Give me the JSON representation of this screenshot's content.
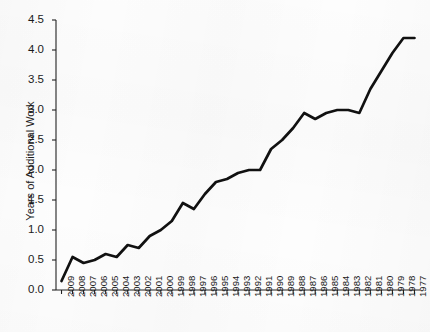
{
  "chart_data": {
    "type": "line",
    "title": "",
    "xlabel": "",
    "ylabel": "Years of Additional Work",
    "ylim": [
      0.0,
      4.5
    ],
    "ytick_labels": [
      "0.0",
      "0.5",
      "1.0",
      "1.5",
      "2.0",
      "2.5",
      "3.0",
      "3.5",
      "4.0",
      "4.5"
    ],
    "ytick_values": [
      0.0,
      0.5,
      1.0,
      1.5,
      2.0,
      2.5,
      3.0,
      3.5,
      4.0,
      4.5
    ],
    "grid": false,
    "legend": false,
    "legend_position": "none",
    "line_color": "#111111",
    "categories": [
      "2009",
      "2008",
      "2007",
      "2006",
      "2005",
      "2004",
      "2003",
      "2002",
      "2001",
      "2000",
      "1999",
      "1998",
      "1997",
      "1996",
      "1995",
      "1994",
      "1993",
      "1992",
      "1991",
      "1990",
      "1989",
      "1988",
      "1987",
      "1986",
      "1985",
      "1984",
      "1983",
      "1982",
      "1981",
      "1980",
      "1979",
      "1978",
      "1977"
    ],
    "values": [
      0.15,
      0.55,
      0.45,
      0.5,
      0.6,
      0.55,
      0.75,
      0.7,
      0.9,
      1.0,
      1.15,
      1.45,
      1.35,
      1.6,
      1.8,
      1.85,
      1.95,
      2.0,
      2.0,
      2.35,
      2.5,
      2.7,
      2.95,
      2.85,
      2.95,
      3.0,
      3.0,
      2.95,
      3.35,
      3.65,
      3.95,
      4.2,
      4.2
    ]
  }
}
